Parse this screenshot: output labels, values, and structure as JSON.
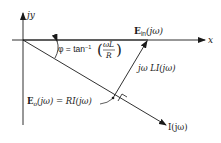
{
  "diagram": {
    "type": "phasor-diagram",
    "axes": {
      "x_label": "x",
      "y_label": "jy"
    },
    "vectors": {
      "input": {
        "label": "E",
        "subscript": "in",
        "arg": "(jω)"
      },
      "inductor": {
        "label": "jω LI(jω)"
      },
      "output": {
        "label": "E",
        "subscript": "o",
        "arg": "(jω) = RI(jω)"
      },
      "current": {
        "label": "I(jω)"
      }
    },
    "angle": {
      "prefix": "φ = tan",
      "superscript": "−1",
      "numerator": "ωL",
      "denominator": "R"
    },
    "colors": {
      "ink": "#1a1a1a",
      "background": "#ffffff"
    }
  }
}
